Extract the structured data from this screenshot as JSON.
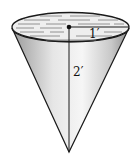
{
  "diagram": {
    "labels": {
      "radius": "1′",
      "height": "2′"
    },
    "colors": {
      "outline": "#1a1a1a",
      "liquid_surface": "#efefef",
      "cone_light": "#f4f4f4",
      "cone_dark": "#8c8c8c"
    }
  }
}
